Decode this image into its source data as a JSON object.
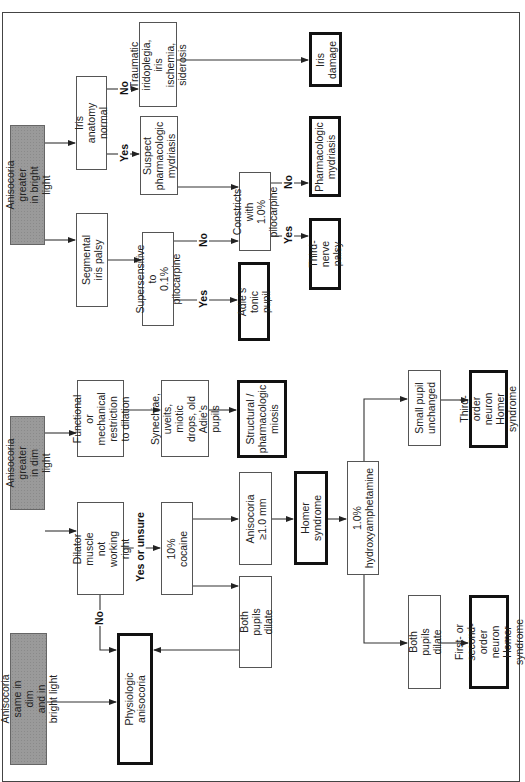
{
  "diagram": {
    "orientation": "rotated-90-ccw",
    "roots": {
      "bright": "Anisocoria greater\nin bright light",
      "dim": "Anisocoria greater\nin dim light",
      "same": "Anisocoria same in dim\nand in bright light"
    },
    "nodes": {
      "iris_anatomy_normal": "Iris anatomy normal",
      "traumatic": "Traumatic\niridoplegia, iris\nischemia, siderosis",
      "iris_damage": "Iris\ndamage",
      "suspect_pharm_mydriasis": "Suspect\npharmacologic\nmydriasis",
      "segmental_iris_palsy": "Segmental iris palsy",
      "supersensitive": "Supersensitive to\n0.1% pilocarpine",
      "constricts": "Constricts with\n1.0% pilocarpine",
      "pharm_mydriasis": "Pharmacologic\nmydriasis",
      "third_nerve_palsy": "Third-nerve\npalsy",
      "adies_tonic_pupil": "Adie's tonic pupil",
      "functional_restriction": "Functional or\nmechanical\nrestriction to dilation",
      "synechiae": "Synechiae, uveits,\nmiotic drops, old\nAdie's pupils",
      "structural_miosis": "Structural /\npharmacologic\nmiosis",
      "dilator_muscle": "Dilator muscle\nnot\nworking right",
      "cocaine": "10% cocaine",
      "anisocoria_1mm": "Anisocoria\n≥1.0 mm",
      "both_pupils_dilate_1": "Both pupils dilate",
      "homer_syndrome": "Homer syndrome",
      "hydroxyamphetamine": "1.0%\nhydroxyamphetamine",
      "small_pupil_unchanged": "Small pupil\nunchanged",
      "third_order_neuron": "Third-order neuron\nHomer syndrome",
      "both_pupils_dilate_2": "Both pupils dilate",
      "first_second_order": "First- or second-\norder neuron\nHomer syndrome",
      "physiologic_anisocoria": "Physiologic\nanisocoria"
    },
    "edge_labels": {
      "no": "No",
      "yes": "Yes",
      "yes_or_unsure": "Yes or unsure"
    },
    "colors": {
      "root_fill": "#9a9a9a",
      "line": "#333333",
      "terminal_border": "#111111"
    }
  }
}
